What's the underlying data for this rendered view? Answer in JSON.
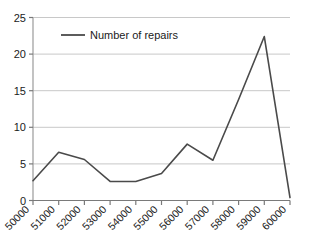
{
  "chart_data": {
    "type": "line",
    "title": "",
    "subtitle": "",
    "xlabel": "",
    "ylabel": "",
    "categories": [
      "50000",
      "51000",
      "52000",
      "53000",
      "54000",
      "55000",
      "56000",
      "57000",
      "58000",
      "59000",
      "60000"
    ],
    "x": [
      50000,
      51000,
      52000,
      53000,
      54000,
      55000,
      56000,
      57000,
      58000,
      59000,
      60000
    ],
    "series": [
      {
        "name": "Number of repairs",
        "color": "#4a4a4a",
        "values": [
          2.7,
          6.6,
          5.6,
          2.6,
          2.6,
          3.7,
          7.7,
          5.5,
          13.8,
          22.4,
          0.4
        ]
      }
    ],
    "ylim": [
      0,
      25
    ],
    "yticks": [
      0,
      5,
      10,
      15,
      20,
      25
    ],
    "ytick_labels": [
      "0",
      "5",
      "10",
      "15",
      "20",
      "25"
    ],
    "xtick_labels": [
      "50000",
      "51000",
      "52000",
      "53000",
      "54000",
      "55000",
      "56000",
      "57000",
      "58000",
      "59000",
      "60000"
    ],
    "grid": {
      "horizontal": true,
      "vertical": false,
      "color": "#c8c8c8"
    },
    "legend": {
      "position": "top-left-inside",
      "entries": [
        {
          "label": "Number of repairs",
          "color": "#4a4a4a",
          "marker": "line"
        }
      ]
    },
    "axis": {
      "y_axis_line_color": "#9a9a9a",
      "x_axis_line_color": "#7a7a7a",
      "tick_color": "#7a7a7a"
    },
    "background": "#ffffff",
    "xtick_label_rotation_deg": -45
  }
}
